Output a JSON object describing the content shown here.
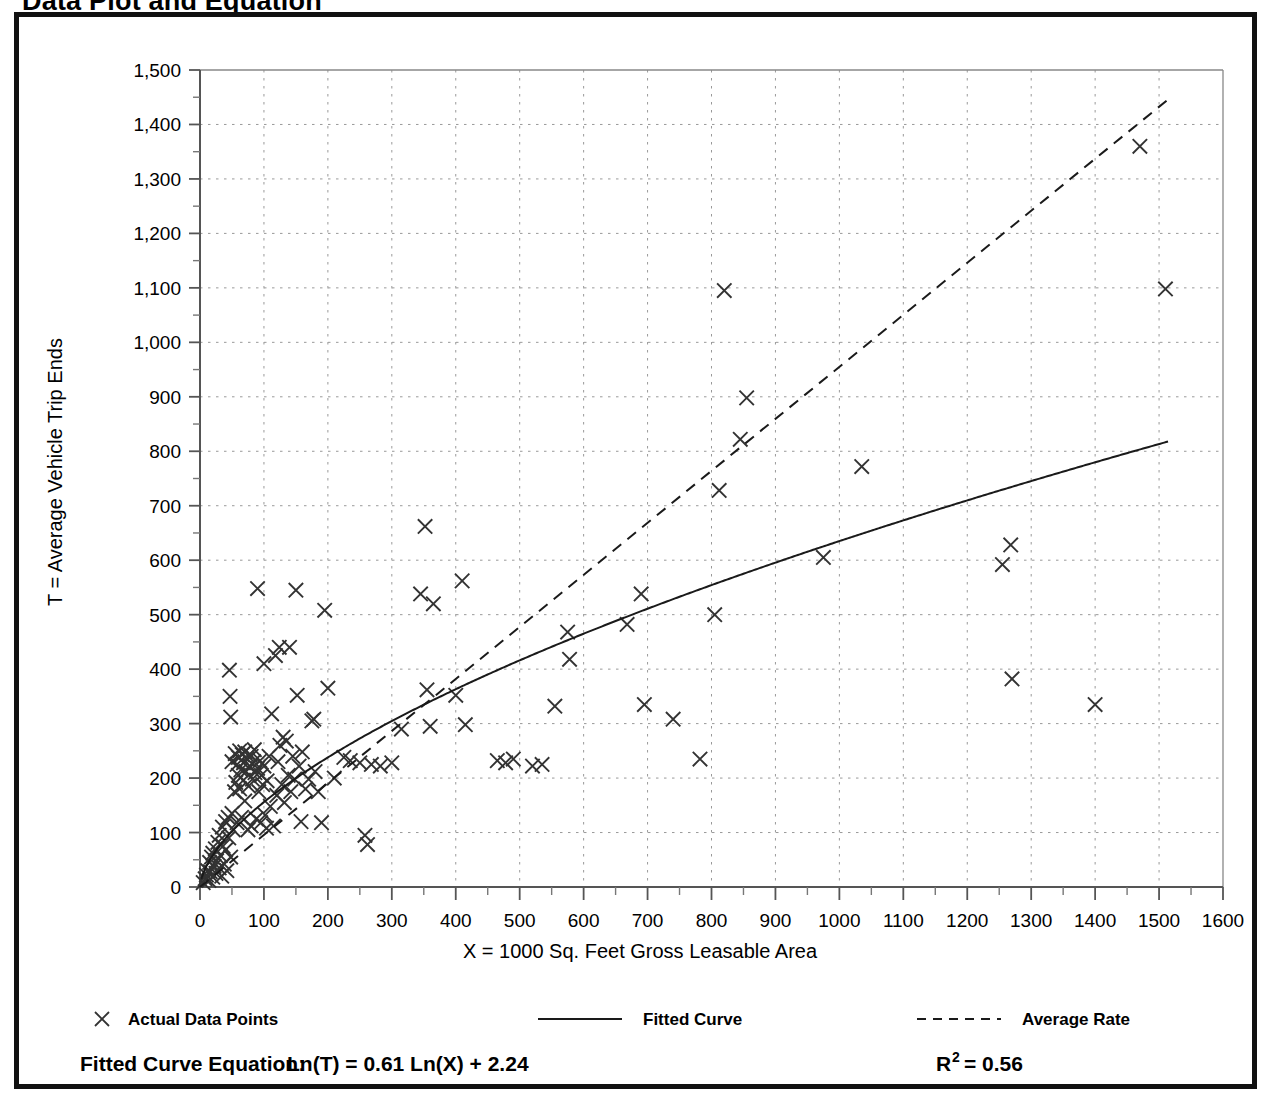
{
  "page_title": "Data Plot and Equation",
  "chart_data": {
    "type": "scatter",
    "title": "Data Plot and Equation",
    "xlabel": "X = 1000 Sq. Feet Gross Leasable Area",
    "ylabel": "T = Average Vehicle Trip Ends",
    "xlim": [
      0,
      1600
    ],
    "ylim": [
      0,
      1500
    ],
    "xticks": [
      0,
      100,
      200,
      300,
      400,
      500,
      600,
      700,
      800,
      900,
      1000,
      1100,
      1200,
      1300,
      1400,
      1500,
      1600
    ],
    "xtick_labels": [
      "0",
      "100",
      "200",
      "300",
      "400",
      "500",
      "600",
      "700",
      "800",
      "900",
      "1000",
      "1100",
      "1200",
      "1300",
      "1400",
      "1500",
      "1600"
    ],
    "yticks": [
      0,
      100,
      200,
      300,
      400,
      500,
      600,
      700,
      800,
      900,
      1000,
      1100,
      1200,
      1300,
      1400,
      1500
    ],
    "ytick_labels": [
      "0",
      "100",
      "200",
      "300",
      "400",
      "500",
      "600",
      "700",
      "800",
      "900",
      "1,000",
      "1,100",
      "1,200",
      "1,300",
      "1,400",
      "1,500"
    ],
    "minor_tick_interval": 50,
    "grid": true,
    "grid_style": "dotted",
    "grid_color": "#999999",
    "grid_spacing_x": 100,
    "grid_spacing_y": 100,
    "legend_position": "below-axis",
    "series": [
      {
        "name": "Actual Data Points",
        "marker": "x",
        "color": "#333333",
        "points": [
          [
            5,
            8
          ],
          [
            8,
            15
          ],
          [
            10,
            22
          ],
          [
            12,
            30
          ],
          [
            14,
            12
          ],
          [
            15,
            45
          ],
          [
            16,
            28
          ],
          [
            18,
            55
          ],
          [
            20,
            18
          ],
          [
            20,
            62
          ],
          [
            22,
            38
          ],
          [
            24,
            70
          ],
          [
            25,
            25
          ],
          [
            26,
            48
          ],
          [
            28,
            82
          ],
          [
            30,
            35
          ],
          [
            30,
            95
          ],
          [
            32,
            58
          ],
          [
            34,
            20
          ],
          [
            35,
            110
          ],
          [
            36,
            75
          ],
          [
            38,
            42
          ],
          [
            40,
            120
          ],
          [
            40,
            68
          ],
          [
            42,
            30
          ],
          [
            44,
            128
          ],
          [
            45,
            90
          ],
          [
            46,
            398
          ],
          [
            47,
            350
          ],
          [
            48,
            312
          ],
          [
            48,
            55
          ],
          [
            50,
            135
          ],
          [
            50,
            230
          ],
          [
            52,
            105
          ],
          [
            54,
            175
          ],
          [
            55,
            245
          ],
          [
            56,
            192
          ],
          [
            58,
            225
          ],
          [
            58,
            118
          ],
          [
            60,
            238
          ],
          [
            60,
            205
          ],
          [
            62,
            180
          ],
          [
            62,
            250
          ],
          [
            64,
            215
          ],
          [
            65,
            128
          ],
          [
            66,
            243
          ],
          [
            68,
            196
          ],
          [
            68,
            228
          ],
          [
            70,
            248
          ],
          [
            70,
            158
          ],
          [
            72,
            212
          ],
          [
            74,
            235
          ],
          [
            75,
            105
          ],
          [
            76,
            185
          ],
          [
            78,
            222
          ],
          [
            78,
            244
          ],
          [
            80,
            240
          ],
          [
            80,
            112
          ],
          [
            82,
            198
          ],
          [
            84,
            230
          ],
          [
            85,
            252
          ],
          [
            86,
            210
          ],
          [
            88,
            125
          ],
          [
            90,
            218
          ],
          [
            90,
            548
          ],
          [
            92,
            175
          ],
          [
            94,
            232
          ],
          [
            95,
            118
          ],
          [
            96,
            205
          ],
          [
            98,
            188
          ],
          [
            100,
            410
          ],
          [
            100,
            222
          ],
          [
            102,
            132
          ],
          [
            104,
            108
          ],
          [
            105,
            195
          ],
          [
            108,
            240
          ],
          [
            110,
            148
          ],
          [
            112,
            318
          ],
          [
            115,
            112
          ],
          [
            118,
            425
          ],
          [
            120,
            168
          ],
          [
            122,
            230
          ],
          [
            124,
            440
          ],
          [
            125,
            260
          ],
          [
            128,
            188
          ],
          [
            130,
            275
          ],
          [
            132,
            155
          ],
          [
            135,
            268
          ],
          [
            138,
            205
          ],
          [
            140,
            440
          ],
          [
            142,
            175
          ],
          [
            145,
            240
          ],
          [
            148,
            198
          ],
          [
            150,
            545
          ],
          [
            152,
            352
          ],
          [
            155,
            222
          ],
          [
            158,
            120
          ],
          [
            160,
            248
          ],
          [
            165,
            180
          ],
          [
            170,
            198
          ],
          [
            175,
            305
          ],
          [
            178,
            308
          ],
          [
            180,
            212
          ],
          [
            185,
            175
          ],
          [
            190,
            118
          ],
          [
            195,
            508
          ],
          [
            200,
            365
          ],
          [
            210,
            200
          ],
          [
            225,
            238
          ],
          [
            235,
            232
          ],
          [
            250,
            228
          ],
          [
            258,
            95
          ],
          [
            262,
            78
          ],
          [
            268,
            225
          ],
          [
            282,
            222
          ],
          [
            300,
            228
          ],
          [
            315,
            290
          ],
          [
            345,
            538
          ],
          [
            352,
            662
          ],
          [
            355,
            362
          ],
          [
            360,
            295
          ],
          [
            365,
            520
          ],
          [
            400,
            352
          ],
          [
            410,
            562
          ],
          [
            415,
            298
          ],
          [
            465,
            232
          ],
          [
            478,
            228
          ],
          [
            490,
            235
          ],
          [
            520,
            222
          ],
          [
            535,
            225
          ],
          [
            555,
            332
          ],
          [
            575,
            468
          ],
          [
            578,
            418
          ],
          [
            668,
            482
          ],
          [
            690,
            538
          ],
          [
            695,
            335
          ],
          [
            740,
            308
          ],
          [
            782,
            235
          ],
          [
            805,
            500
          ],
          [
            812,
            728
          ],
          [
            820,
            1095
          ],
          [
            845,
            822
          ],
          [
            855,
            898
          ],
          [
            975,
            605
          ],
          [
            1035,
            772
          ],
          [
            1255,
            592
          ],
          [
            1268,
            628
          ],
          [
            1270,
            382
          ],
          [
            1400,
            335
          ],
          [
            1470,
            1360
          ],
          [
            1510,
            1098
          ]
        ]
      }
    ],
    "fitted_curve": {
      "name": "Fitted Curve",
      "style": "solid",
      "color": "#1a1a1a",
      "equation": "Ln(T) = 0.61 Ln(X) + 2.24",
      "a": 2.24,
      "b": 0.61
    },
    "average_rate": {
      "name": "Average Rate",
      "style": "dashed",
      "color": "#1a1a1a",
      "slope": 0.955,
      "x_range": [
        0,
        1515
      ]
    },
    "annotations": {
      "equation_label": "Fitted Curve Equation:",
      "equation_value": "Ln(T) = 0.61 Ln(X) + 2.24",
      "r2_label": "R",
      "r2_exponent": "2",
      "r2_value": "= 0.56"
    }
  },
  "legend": {
    "items": [
      {
        "label": "Actual Data Points",
        "marker": "x"
      },
      {
        "label": "Fitted Curve",
        "marker": "solid-line"
      },
      {
        "label": "Average Rate",
        "marker": "dashed-line"
      }
    ]
  }
}
